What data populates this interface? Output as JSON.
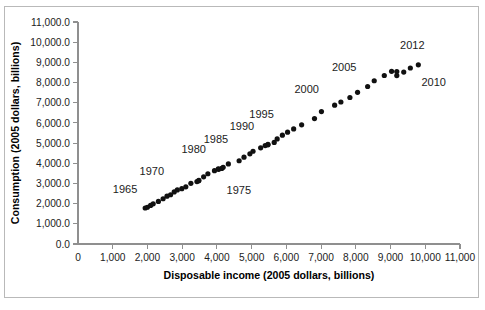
{
  "figure": {
    "border_color": "#b9b9b9",
    "background": "#ffffff"
  },
  "chart_data": {
    "type": "scatter",
    "title": "",
    "xlabel": "Disposable income (2005 dollars, billions)",
    "ylabel": "Consumption (2005 dollars, billions)",
    "xlim": [
      0,
      11000
    ],
    "ylim": [
      0,
      11000
    ],
    "xticks": [
      0,
      1000,
      2000,
      3000,
      4000,
      5000,
      6000,
      7000,
      8000,
      9000,
      10000,
      11000
    ],
    "xticklabels": [
      "0",
      "1,000",
      "2,000",
      "3,000",
      "4,000",
      "5,000",
      "6,000",
      "7,000",
      "8,000",
      "9,000",
      "10,000",
      "11,000"
    ],
    "yticks": [
      0,
      1000,
      2000,
      3000,
      4000,
      5000,
      6000,
      7000,
      8000,
      9000,
      10000,
      11000
    ],
    "yticklabels": [
      "0.0",
      "1,000.0",
      "2,000.0",
      "3,000.0",
      "4,000.0",
      "5,000.0",
      "6,000.0",
      "7,000.0",
      "8,000.0",
      "9,000.0",
      "10,000.0",
      "11,000.0"
    ],
    "grid": false,
    "legend": null,
    "marker_color": "#111111",
    "marker_size": 2.6,
    "series": [
      {
        "name": "Consumption vs Disposable income",
        "points": [
          {
            "year": 1960,
            "x": 1935,
            "y": 1785
          },
          {
            "year": 1961,
            "x": 1998,
            "y": 1821
          },
          {
            "year": 1962,
            "x": 2090,
            "y": 1911
          },
          {
            "year": 1963,
            "x": 2165,
            "y": 1989
          },
          {
            "year": 1964,
            "x": 2315,
            "y": 2108
          },
          {
            "year": 1965,
            "x": 2450,
            "y": 2241
          },
          {
            "year": 1966,
            "x": 2562,
            "y": 2369
          },
          {
            "year": 1967,
            "x": 2665,
            "y": 2440
          },
          {
            "year": 1968,
            "x": 2770,
            "y": 2580
          },
          {
            "year": 1969,
            "x": 2860,
            "y": 2677
          },
          {
            "year": 1970,
            "x": 2990,
            "y": 2741
          },
          {
            "year": 1971,
            "x": 3105,
            "y": 2832
          },
          {
            "year": 1972,
            "x": 3250,
            "y": 3006
          },
          {
            "year": 1973,
            "x": 3475,
            "y": 3132
          },
          {
            "year": 1974,
            "x": 3425,
            "y": 3093
          },
          {
            "year": 1975,
            "x": 3480,
            "y": 3156
          },
          {
            "year": 1976,
            "x": 3618,
            "y": 3328
          },
          {
            "year": 1977,
            "x": 3740,
            "y": 3481
          },
          {
            "year": 1978,
            "x": 3930,
            "y": 3635
          },
          {
            "year": 1979,
            "x": 4040,
            "y": 3724
          },
          {
            "year": 1980,
            "x": 4050,
            "y": 3701
          },
          {
            "year": 1981,
            "x": 4140,
            "y": 3745
          },
          {
            "year": 1982,
            "x": 4180,
            "y": 3800
          },
          {
            "year": 1983,
            "x": 4330,
            "y": 3970
          },
          {
            "year": 1984,
            "x": 4640,
            "y": 4125
          },
          {
            "year": 1985,
            "x": 4780,
            "y": 4302
          },
          {
            "year": 1986,
            "x": 4950,
            "y": 4470
          },
          {
            "year": 1987,
            "x": 5040,
            "y": 4596
          },
          {
            "year": 1988,
            "x": 5260,
            "y": 4766
          },
          {
            "year": 1989,
            "x": 5390,
            "y": 4876
          },
          {
            "year": 1990,
            "x": 5470,
            "y": 4940
          },
          {
            "year": 1991,
            "x": 5470,
            "y": 4915
          },
          {
            "year": 1992,
            "x": 5650,
            "y": 5035
          },
          {
            "year": 1993,
            "x": 5735,
            "y": 5205
          },
          {
            "year": 1994,
            "x": 5885,
            "y": 5390
          },
          {
            "year": 1995,
            "x": 6035,
            "y": 5540
          },
          {
            "year": 1996,
            "x": 6210,
            "y": 5700
          },
          {
            "year": 1997,
            "x": 6440,
            "y": 5905
          },
          {
            "year": 1998,
            "x": 6810,
            "y": 6215
          },
          {
            "year": 1999,
            "x": 7010,
            "y": 6560
          },
          {
            "year": 2000,
            "x": 7390,
            "y": 6880
          },
          {
            "year": 2001,
            "x": 7570,
            "y": 7035
          },
          {
            "year": 2002,
            "x": 7830,
            "y": 7260
          },
          {
            "year": 2003,
            "x": 8050,
            "y": 7515
          },
          {
            "year": 2004,
            "x": 8340,
            "y": 7805
          },
          {
            "year": 2005,
            "x": 8530,
            "y": 8090
          },
          {
            "year": 2006,
            "x": 8820,
            "y": 8350
          },
          {
            "year": 2007,
            "x": 9030,
            "y": 8555
          },
          {
            "year": 2008,
            "x": 9180,
            "y": 8545
          },
          {
            "year": 2009,
            "x": 9180,
            "y": 8345
          },
          {
            "year": 2010,
            "x": 9380,
            "y": 8520
          },
          {
            "year": 2011,
            "x": 9570,
            "y": 8720
          },
          {
            "year": 2012,
            "x": 9800,
            "y": 8880
          }
        ]
      }
    ],
    "annotations": [
      {
        "text": "1965",
        "x": 2450,
        "y": 2241,
        "dx": -38,
        "dy": -6
      },
      {
        "text": "1970",
        "x": 2990,
        "y": 2741,
        "dx": -30,
        "dy": -14
      },
      {
        "text": "1975",
        "x": 3480,
        "y": 3156,
        "dx": 40,
        "dy": 14
      },
      {
        "text": "1980",
        "x": 4050,
        "y": 3701,
        "dx": -25,
        "dy": -16
      },
      {
        "text": "1985",
        "x": 4780,
        "y": 4302,
        "dx": -28,
        "dy": -14
      },
      {
        "text": "1990",
        "x": 5470,
        "y": 4940,
        "dx": -26,
        "dy": -14
      },
      {
        "text": "1995",
        "x": 6035,
        "y": 5540,
        "dx": -26,
        "dy": -14
      },
      {
        "text": "2000",
        "x": 7390,
        "y": 6880,
        "dx": -28,
        "dy": -12
      },
      {
        "text": "2005",
        "x": 8530,
        "y": 8090,
        "dx": -30,
        "dy": -10
      },
      {
        "text": "2010",
        "x": 9380,
        "y": 8520,
        "dx": 30,
        "dy": 14
      },
      {
        "text": "2012",
        "x": 9800,
        "y": 8880,
        "dx": -6,
        "dy": -16
      }
    ]
  }
}
